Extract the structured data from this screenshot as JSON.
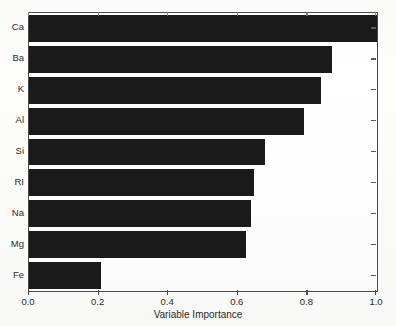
{
  "chart_data": {
    "type": "bar",
    "orientation": "horizontal",
    "title": "",
    "subtitle": "",
    "xlabel": "Variable Importance",
    "ylabel": "",
    "categories": [
      "Ca",
      "Ba",
      "K",
      "Al",
      "Si",
      "RI",
      "Na",
      "Mg",
      "Fe"
    ],
    "values": [
      1.0,
      0.87,
      0.838,
      0.79,
      0.677,
      0.647,
      0.638,
      0.624,
      0.207
    ],
    "series": [
      {
        "name": "Variable Importance",
        "values": [
          1.0,
          0.87,
          0.838,
          0.79,
          0.677,
          0.647,
          0.638,
          0.624,
          0.207
        ]
      }
    ],
    "xlim": [
      0.0,
      1.0
    ],
    "x_ticks": [
      0.0,
      0.2,
      0.4,
      0.6,
      0.8,
      1.0
    ],
    "x_ticklabels": [
      "0.0",
      "0.2",
      "0.4",
      "0.6",
      "0.8",
      "1.0"
    ],
    "grid": false,
    "legend": false,
    "legend_position": "none",
    "bar_color": "#1a1a1a",
    "background_color": "#ffffff",
    "axis_color": "#4a4a4a",
    "frame": "box"
  },
  "axis": {
    "x_title": "Variable Importance"
  }
}
